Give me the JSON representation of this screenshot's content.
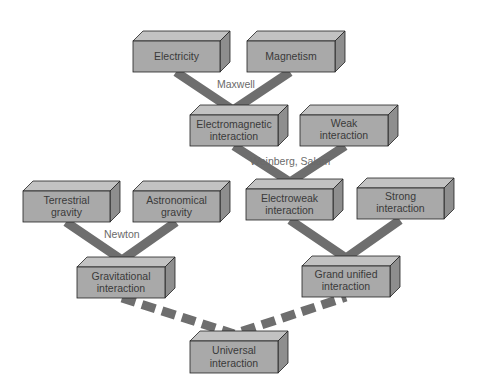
{
  "diagram": {
    "colors": {
      "box_front": "#a9a9a9",
      "box_top": "#c2c2c2",
      "box_side": "#8e8e8e",
      "box_stroke": "#222222",
      "connector": "#6e6e6e",
      "text": "#3a3a3a"
    },
    "nodes": [
      {
        "id": "electricity",
        "lines": [
          "Electricity"
        ]
      },
      {
        "id": "magnetism",
        "lines": [
          "Magnetism"
        ]
      },
      {
        "id": "electromagnetic",
        "lines": [
          "Electromagnetic",
          "interaction"
        ]
      },
      {
        "id": "weak",
        "lines": [
          "Weak",
          "interaction"
        ]
      },
      {
        "id": "terrestrial",
        "lines": [
          "Terrestrial",
          "gravity"
        ]
      },
      {
        "id": "astronomical",
        "lines": [
          "Astronomical",
          "gravity"
        ]
      },
      {
        "id": "electroweak",
        "lines": [
          "Electroweak",
          "interaction"
        ]
      },
      {
        "id": "strong",
        "lines": [
          "Strong",
          "interaction"
        ]
      },
      {
        "id": "gravitational",
        "lines": [
          "Gravitational",
          "interaction"
        ]
      },
      {
        "id": "grand_unified",
        "lines": [
          "Grand unified",
          "interaction"
        ]
      },
      {
        "id": "universal",
        "lines": [
          "Universal",
          "interaction"
        ]
      }
    ],
    "connections": [
      {
        "from": [
          "electricity",
          "magnetism"
        ],
        "to": "electromagnetic",
        "label": "Maxwell",
        "style": "solid"
      },
      {
        "from": [
          "electromagnetic",
          "weak"
        ],
        "to": "electroweak",
        "label": "Weinberg, Salam",
        "style": "solid"
      },
      {
        "from": [
          "terrestrial",
          "astronomical"
        ],
        "to": "gravitational",
        "label": "Newton",
        "style": "solid"
      },
      {
        "from": [
          "electroweak",
          "strong"
        ],
        "to": "grand_unified",
        "label": "",
        "style": "solid"
      },
      {
        "from": [
          "gravitational",
          "grand_unified"
        ],
        "to": "universal",
        "label": "",
        "style": "dashed"
      }
    ]
  }
}
